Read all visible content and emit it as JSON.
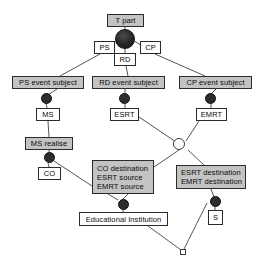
{
  "diagram": {
    "colors": {
      "gray_box_fill": "#c3c3c3",
      "white_box_fill": "#ffffff",
      "border": "#2b2b2b",
      "filled_node": "#2d2d2d",
      "hollow_node": "#ffffff",
      "edge": "#555555",
      "background": "#ffffff"
    },
    "nodes": [
      {
        "id": "t_part",
        "label": "T part",
        "style": "gray",
        "x": 107,
        "y": 14,
        "w": 37,
        "h": 13
      },
      {
        "id": "ps",
        "label": "PS",
        "style": "white",
        "x": 94,
        "y": 41,
        "w": 21,
        "h": 13
      },
      {
        "id": "cp",
        "label": "CP",
        "style": "white",
        "x": 140,
        "y": 41,
        "w": 21,
        "h": 13
      },
      {
        "id": "rd",
        "label": "RD",
        "style": "white",
        "x": 114,
        "y": 53,
        "w": 22,
        "h": 13
      },
      {
        "id": "ps_event_subject",
        "label": "PS event subject",
        "style": "gray",
        "x": 12,
        "y": 76,
        "w": 72,
        "h": 13
      },
      {
        "id": "rd_event_subject",
        "label": "RD event subject",
        "style": "gray",
        "x": 92,
        "y": 76,
        "w": 73,
        "h": 13
      },
      {
        "id": "cp_event_subject",
        "label": "CP event subject",
        "style": "gray",
        "x": 179,
        "y": 76,
        "w": 73,
        "h": 13
      },
      {
        "id": "ms",
        "label": "MS",
        "style": "white",
        "x": 36,
        "y": 108,
        "w": 24,
        "h": 13
      },
      {
        "id": "esrt",
        "label": "ESRT",
        "style": "white",
        "x": 110,
        "y": 108,
        "w": 29,
        "h": 13
      },
      {
        "id": "emrt",
        "label": "EMRT",
        "style": "white",
        "x": 196,
        "y": 108,
        "w": 31,
        "h": 13
      },
      {
        "id": "ms_realise",
        "label": "MS realise",
        "style": "gray",
        "x": 25,
        "y": 137,
        "w": 48,
        "h": 13
      },
      {
        "id": "co",
        "label": "CO",
        "style": "white",
        "x": 38,
        "y": 167,
        "w": 23,
        "h": 13
      },
      {
        "id": "educational_inst",
        "label": "Educational Institution",
        "style": "white",
        "x": 79,
        "y": 212,
        "w": 89,
        "h": 14
      },
      {
        "id": "s",
        "label": "S",
        "style": "white",
        "x": 208,
        "y": 210,
        "w": 15,
        "h": 15
      }
    ],
    "multiline_nodes": [
      {
        "id": "co_destination_group",
        "lines": [
          "CO destination",
          "ESRT source",
          "EMRT source"
        ],
        "style": "gray",
        "x": 92,
        "y": 160,
        "w": 62,
        "h": 34
      },
      {
        "id": "esrt_destination_group",
        "lines": [
          "ESRT destination",
          "EMRT destination"
        ],
        "style": "gray",
        "x": 176,
        "y": 165,
        "w": 70,
        "h": 24
      }
    ],
    "junctions": [
      {
        "id": "t_part_junction",
        "type": "filled-large",
        "x": 115,
        "y": 29,
        "d": 20
      },
      {
        "id": "ps_junction",
        "type": "filled",
        "x": 41,
        "y": 93,
        "d": 11
      },
      {
        "id": "rd_junction",
        "type": "filled",
        "x": 119,
        "y": 93,
        "d": 11
      },
      {
        "id": "cp_junction",
        "type": "filled",
        "x": 205,
        "y": 93,
        "d": 11
      },
      {
        "id": "ms_realise_junction",
        "type": "filled",
        "x": 44,
        "y": 152,
        "d": 11
      },
      {
        "id": "center_junction",
        "type": "hollow",
        "x": 179,
        "y": 141,
        "d": 12
      },
      {
        "id": "edu_inst_junction",
        "type": "filled",
        "x": 118,
        "y": 199,
        "d": 11
      },
      {
        "id": "s_junction",
        "type": "filled",
        "x": 210,
        "y": 196,
        "d": 11
      },
      {
        "id": "bottom_terminal",
        "type": "square-hollow",
        "x": 180,
        "y": 249,
        "d": 6
      }
    ],
    "edges": [
      {
        "from": "t_part",
        "to": "t_part_junction",
        "x1": 125,
        "y1": 27,
        "x2": 125,
        "y2": 30
      },
      {
        "from": "t_part_junction",
        "to": "ps",
        "x1": 117,
        "y1": 40,
        "x2": 109,
        "y2": 46
      },
      {
        "from": "t_part_junction",
        "to": "cp",
        "x1": 133,
        "y1": 40,
        "x2": 142,
        "y2": 46
      },
      {
        "from": "t_part_junction",
        "to": "rd",
        "x1": 125,
        "y1": 48,
        "x2": 125,
        "y2": 53
      },
      {
        "from": "ps",
        "to": "ps_event_subject",
        "x1": 100,
        "y1": 54,
        "x2": 60,
        "y2": 76
      },
      {
        "from": "rd",
        "to": "rd_event_subject",
        "x1": 126,
        "y1": 66,
        "x2": 128,
        "y2": 76
      },
      {
        "from": "cp",
        "to": "cp_event_subject",
        "x1": 155,
        "y1": 54,
        "x2": 205,
        "y2": 76
      },
      {
        "from": "ps_event_subject",
        "to": "ps_junction",
        "x1": 57,
        "y1": 89,
        "x2": 48,
        "y2": 95
      },
      {
        "from": "ps_junction",
        "to": "ms",
        "x1": 46,
        "y1": 103,
        "x2": 47,
        "y2": 108
      },
      {
        "from": "rd_event_subject",
        "to": "rd_junction",
        "x1": 125,
        "y1": 89,
        "x2": 125,
        "y2": 93
      },
      {
        "from": "rd_junction",
        "to": "esrt",
        "x1": 125,
        "y1": 104,
        "x2": 125,
        "y2": 108
      },
      {
        "from": "cp_event_subject",
        "to": "cp_junction",
        "x1": 216,
        "y1": 89,
        "x2": 211,
        "y2": 94
      },
      {
        "from": "cp_junction",
        "to": "emrt",
        "x1": 211,
        "y1": 104,
        "x2": 211,
        "y2": 108
      },
      {
        "from": "ms",
        "to": "ms_realise",
        "x1": 48,
        "y1": 121,
        "x2": 49,
        "y2": 137
      },
      {
        "from": "ms_realise",
        "to": "ms_realise_junction",
        "x1": 49,
        "y1": 150,
        "x2": 49,
        "y2": 152
      },
      {
        "from": "ms_realise_junction",
        "to": "co",
        "x1": 48,
        "y1": 163,
        "x2": 49,
        "y2": 167
      },
      {
        "from": "ms_realise_junction",
        "to": "co_destination_group",
        "x1": 54,
        "y1": 161,
        "x2": 92,
        "y2": 186
      },
      {
        "from": "esrt",
        "to": "center_junction",
        "x1": 139,
        "y1": 117,
        "x2": 179,
        "y2": 144
      },
      {
        "from": "emrt",
        "to": "center_junction",
        "x1": 199,
        "y1": 121,
        "x2": 186,
        "y2": 141
      },
      {
        "from": "center_junction",
        "to": "co_destination_group",
        "x1": 179,
        "y1": 150,
        "x2": 154,
        "y2": 167
      },
      {
        "from": "center_junction",
        "to": "esrt_destination_group",
        "x1": 188,
        "y1": 150,
        "x2": 204,
        "y2": 165
      },
      {
        "from": "co_destination_group",
        "to": "edu_inst_junction",
        "x1": 108,
        "y1": 194,
        "x2": 118,
        "y2": 200
      },
      {
        "from": "co_destination_group",
        "to": "edu_inst_junction2",
        "x1": 128,
        "y1": 194,
        "x2": 122,
        "y2": 200
      },
      {
        "from": "edu_inst_junction",
        "to": "educational_inst",
        "x1": 123,
        "y1": 209,
        "x2": 123,
        "y2": 212
      },
      {
        "from": "esrt_destination_group",
        "to": "s_junction",
        "x1": 211,
        "y1": 189,
        "x2": 214,
        "y2": 197
      },
      {
        "from": "s_junction",
        "to": "s",
        "x1": 215,
        "y1": 206,
        "x2": 215,
        "y2": 210
      },
      {
        "from": "educational_inst",
        "to": "bottom_terminal",
        "x1": 148,
        "y1": 226,
        "x2": 181,
        "y2": 250
      },
      {
        "from": "s_junction",
        "to": "bottom_terminal",
        "x1": 207,
        "y1": 203,
        "x2": 184,
        "y2": 249
      }
    ]
  }
}
